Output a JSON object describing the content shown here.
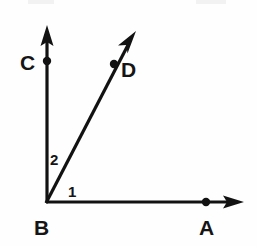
{
  "figure": {
    "background_color": "#fefefe",
    "ink_color": "#121212",
    "width": 257,
    "height": 246,
    "vertex_labels": [
      {
        "id": "C",
        "text": "C",
        "x": 20,
        "y": 70
      },
      {
        "id": "D",
        "text": "D",
        "x": 121,
        "y": 77
      },
      {
        "id": "B",
        "text": "B",
        "x": 34,
        "y": 235
      },
      {
        "id": "A",
        "text": "A",
        "x": 199,
        "y": 235
      }
    ],
    "angle_labels": [
      {
        "id": "2",
        "text": "2",
        "x": 50,
        "y": 165
      },
      {
        "id": "1",
        "text": "1",
        "x": 68,
        "y": 197
      }
    ],
    "points": [
      {
        "id": "B",
        "x": 47,
        "y": 202,
        "marked": false
      },
      {
        "id": "C",
        "x": 47,
        "y": 61,
        "marked": true
      },
      {
        "id": "A",
        "x": 206,
        "y": 202,
        "marked": true
      },
      {
        "id": "D",
        "x": 114,
        "y": 64,
        "marked": true
      }
    ],
    "rays": [
      {
        "id": "BC",
        "from": "B",
        "to_label": "C",
        "x1": 47,
        "y1": 202,
        "x2": 47,
        "y2": 34,
        "arrow": true
      },
      {
        "id": "BA",
        "from": "B",
        "to_label": "A",
        "x1": 47,
        "y1": 202,
        "x2": 240,
        "y2": 202,
        "arrow": true
      },
      {
        "id": "BD",
        "from": "B",
        "to_label": "D",
        "x1": 47,
        "y1": 202,
        "x2": 132,
        "y2": 39,
        "arrow": true
      }
    ]
  }
}
